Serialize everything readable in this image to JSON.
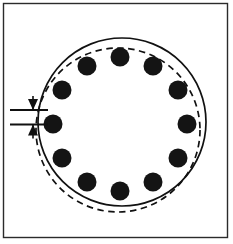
{
  "figure": {
    "canvas": {
      "width": 233,
      "height": 244,
      "background": "#ffffff"
    },
    "frame": {
      "label": "outer-border-frame",
      "x": 3.5,
      "y": 3.5,
      "width": 224,
      "height": 234,
      "stroke": "#2b2b2b",
      "stroke_width": 1.4
    },
    "colors": {
      "ink": "#111111",
      "frame": "#2b2b2b",
      "paper": "#ffffff",
      "dot_fill": "#141414"
    },
    "solid_circle": {
      "label": "nominal-bolt-circle",
      "cx": 122,
      "cy": 122,
      "r": 84,
      "style": "solid",
      "stroke_width": 1.7
    },
    "dashed_circle": {
      "label": "displaced-bolt-circle",
      "cx": 118,
      "cy": 130,
      "r": 82,
      "style": "dashed",
      "dash_pattern": "6.5 4.5",
      "stroke_width": 1.7
    },
    "bolt_dots": {
      "label": "bolt-hole-markers",
      "count": 12,
      "radius": 9.5,
      "ring_cx": 120,
      "ring_cy": 124,
      "ring_r": 67,
      "fill": "#141414",
      "positions": [
        {
          "index": 1,
          "angle_deg": -90,
          "cx": 120,
          "cy": 57
        },
        {
          "index": 2,
          "angle_deg": -60,
          "cx": 153,
          "cy": 66
        },
        {
          "index": 3,
          "angle_deg": -30,
          "cx": 178,
          "cy": 90
        },
        {
          "index": 4,
          "angle_deg": 0,
          "cx": 187,
          "cy": 124
        },
        {
          "index": 5,
          "angle_deg": 30,
          "cx": 178,
          "cy": 158
        },
        {
          "index": 6,
          "angle_deg": 60,
          "cx": 153,
          "cy": 182
        },
        {
          "index": 7,
          "angle_deg": 90,
          "cx": 120,
          "cy": 191
        },
        {
          "index": 8,
          "angle_deg": 120,
          "cx": 87,
          "cy": 182
        },
        {
          "index": 9,
          "angle_deg": 150,
          "cx": 62,
          "cy": 158
        },
        {
          "index": 10,
          "angle_deg": 180,
          "cx": 53,
          "cy": 124
        },
        {
          "index": 11,
          "angle_deg": 210,
          "cx": 62,
          "cy": 90
        },
        {
          "index": 12,
          "angle_deg": 240,
          "cx": 87,
          "cy": 66
        }
      ]
    },
    "dimension": {
      "label": "vertical-offset-dimension",
      "extension_lines": [
        {
          "id": "upper",
          "x1": 10,
          "x2": 48,
          "y": 110
        },
        {
          "id": "lower",
          "x1": 10,
          "x2": 48,
          "y": 124.5
        }
      ],
      "arrows": [
        {
          "id": "upper-arrow",
          "direction": "down",
          "tip_x": 33,
          "tip_y": 110
        },
        {
          "id": "lower-arrow",
          "direction": "up",
          "tip_x": 33,
          "tip_y": 124.5
        }
      ],
      "value_text": ""
    }
  }
}
